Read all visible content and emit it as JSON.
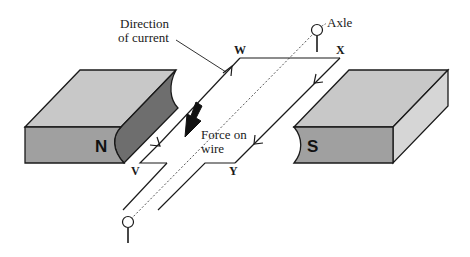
{
  "diagram": {
    "labels": {
      "direction_of_current_line1": "Direction",
      "direction_of_current_line2": "of current",
      "axle": "Axle",
      "force_line1": "Force on",
      "force_line2": "wire",
      "corner_w": "W",
      "corner_x": "X",
      "corner_v": "V",
      "corner_y": "Y",
      "north_pole": "N",
      "south_pole": "S"
    },
    "colors": {
      "magnet_top": "#c8c8c8",
      "magnet_front": "#a0a0a0",
      "magnet_curved_face": "#6e6e6e",
      "magnet_side": "#d4d4d4",
      "outline": "#1a1a1a",
      "force_arrow": "#111111"
    }
  }
}
